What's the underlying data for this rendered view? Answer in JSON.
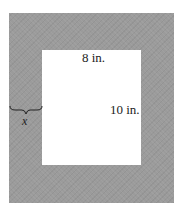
{
  "diagram": {
    "type": "picture-frame",
    "frame_color": "#9b9b9b",
    "picture_color": "#ffffff",
    "labels": {
      "width": "8 in.",
      "height": "10 in.",
      "border": "x"
    }
  }
}
